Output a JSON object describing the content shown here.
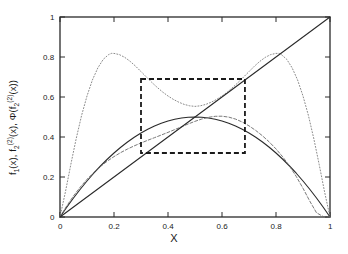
{
  "figure": {
    "background_color": "#ffffff",
    "frame_color": "#2a2a2a",
    "text_color": "#1a1a1a"
  },
  "labels": {
    "xlabel": "X",
    "ylabel_parts": {
      "f1": "f",
      "f1_sub": "1",
      "f1_arg": "(x), ",
      "f2": "f",
      "f2_sub": "2",
      "f2_sup": "(2)",
      "f2_arg": "(x),  ",
      "phi": "Φ(f",
      "phi_sub": "2",
      "phi_sup": "(2)",
      "phi_arg": "(x))"
    },
    "ylabel_plain": "f1(x), f2(2)(x),  Φ(f2(2)(x))"
  },
  "chart_data": {
    "type": "line",
    "title": "",
    "xlabel": "X",
    "ylabel": "f1(x), f2(2)(x), Φ(f2(2)(x))",
    "xlim": [
      0,
      1
    ],
    "ylim": [
      0,
      1
    ],
    "grid": false,
    "legend": "none",
    "xticks": [
      0,
      0.2,
      0.4,
      0.6,
      0.8,
      1
    ],
    "xtick_labels": [
      "0",
      "0.2",
      "0.4",
      "0.6",
      "0.8",
      "1"
    ],
    "yticks": [
      0,
      0.2,
      0.4,
      0.6,
      0.8,
      1
    ],
    "ytick_labels": [
      "0",
      "0.2",
      "0.4",
      "0.6",
      "0.8",
      "1"
    ],
    "series": [
      {
        "name": "f_1(x)",
        "style": "solid",
        "color": "#2a2a2a",
        "width": 1.1,
        "x": [
          0,
          0.025,
          0.05,
          0.075,
          0.1,
          0.125,
          0.15,
          0.175,
          0.2,
          0.225,
          0.25,
          0.275,
          0.3,
          0.325,
          0.35,
          0.375,
          0.4,
          0.425,
          0.45,
          0.475,
          0.5,
          0.525,
          0.55,
          0.575,
          0.6,
          0.625,
          0.65,
          0.675,
          0.7,
          0.725,
          0.75,
          0.775,
          0.8,
          0.825,
          0.85,
          0.875,
          0.9,
          0.925,
          0.95,
          0.975,
          1
        ],
        "y": [
          0,
          0.0488,
          0.095,
          0.1388,
          0.18,
          0.2188,
          0.255,
          0.2888,
          0.32,
          0.3488,
          0.375,
          0.3988,
          0.42,
          0.4388,
          0.455,
          0.4688,
          0.48,
          0.4888,
          0.495,
          0.4988,
          0.5,
          0.4988,
          0.495,
          0.4888,
          0.48,
          0.4688,
          0.455,
          0.4388,
          0.42,
          0.3988,
          0.375,
          0.3488,
          0.32,
          0.2888,
          0.255,
          0.2188,
          0.18,
          0.1388,
          0.095,
          0.0488,
          0
        ]
      },
      {
        "name": "f_2^(2)(x)",
        "style": "dashed-fine",
        "color": "#6a6a6a",
        "width": 0.9,
        "x": [
          0,
          0.025,
          0.05,
          0.075,
          0.1,
          0.125,
          0.15,
          0.175,
          0.2,
          0.225,
          0.25,
          0.275,
          0.3,
          0.325,
          0.35,
          0.375,
          0.4,
          0.425,
          0.45,
          0.475,
          0.5,
          0.525,
          0.55,
          0.575,
          0.6,
          0.625,
          0.65,
          0.675,
          0.7,
          0.725,
          0.75,
          0.775,
          0.8,
          0.825,
          0.85,
          0.875,
          0.9,
          0.925,
          0.95,
          0.975,
          1
        ],
        "y": [
          0,
          0.0555,
          0.1052,
          0.1494,
          0.1884,
          0.2228,
          0.2528,
          0.2791,
          0.3021,
          0.3222,
          0.3399,
          0.3557,
          0.3701,
          0.3836,
          0.3967,
          0.4098,
          0.4232,
          0.4371,
          0.4512,
          0.4652,
          0.4783,
          0.4898,
          0.4985,
          0.5035,
          0.504,
          0.4994,
          0.4896,
          0.4749,
          0.4557,
          0.4326,
          0.4058,
          0.3752,
          0.3404,
          0.3006,
          0.2549,
          0.2026,
          0.1436,
          0.0797,
          0.0212,
          0.002,
          0
        ]
      },
      {
        "name": "Φ(f_2^(2)(x))",
        "style": "dotted",
        "color": "#8a8a8a",
        "width": 1.0,
        "x": [
          0,
          0.02,
          0.04,
          0.06,
          0.08,
          0.1,
          0.12,
          0.14,
          0.16,
          0.18,
          0.19,
          0.2,
          0.22,
          0.24,
          0.26,
          0.28,
          0.3,
          0.32,
          0.34,
          0.36,
          0.38,
          0.4,
          0.42,
          0.44,
          0.46,
          0.48,
          0.5,
          0.52,
          0.54,
          0.56,
          0.58,
          0.6,
          0.62,
          0.64,
          0.66,
          0.68,
          0.7,
          0.72,
          0.74,
          0.76,
          0.78,
          0.8,
          0.81,
          0.82,
          0.84,
          0.86,
          0.88,
          0.9,
          0.92,
          0.94,
          0.96,
          0.98,
          1
        ],
        "y": [
          0,
          0.125,
          0.262,
          0.392,
          0.508,
          0.605,
          0.685,
          0.745,
          0.788,
          0.812,
          0.818,
          0.818,
          0.812,
          0.798,
          0.778,
          0.754,
          0.727,
          0.7,
          0.673,
          0.648,
          0.625,
          0.605,
          0.588,
          0.574,
          0.563,
          0.556,
          0.553,
          0.556,
          0.563,
          0.574,
          0.588,
          0.605,
          0.625,
          0.648,
          0.673,
          0.7,
          0.727,
          0.754,
          0.778,
          0.798,
          0.812,
          0.818,
          0.818,
          0.812,
          0.788,
          0.745,
          0.685,
          0.605,
          0.508,
          0.392,
          0.262,
          0.125,
          0
        ]
      },
      {
        "name": "diagonal y=x",
        "style": "solid",
        "color": "#2a2a2a",
        "width": 1.1,
        "x": [
          0,
          1
        ],
        "y": [
          0,
          1
        ]
      }
    ],
    "annotations": [
      {
        "type": "dashed-rectangle",
        "name": "zoom-region-box",
        "x0": 0.3,
        "x1": 0.685,
        "y0": 0.32,
        "y1": 0.69,
        "color": "#1a1a1a",
        "line_width": 1.8,
        "dash": "5 3"
      }
    ]
  }
}
